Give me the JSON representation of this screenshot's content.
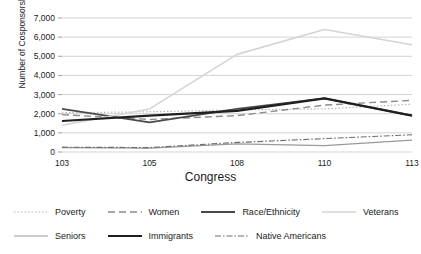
{
  "chart_data": {
    "type": "line",
    "title": "",
    "xlabel": "Congress",
    "ylabel": "Number of Cosponsorships",
    "categories": [
      "103",
      "105",
      "108",
      "110",
      "113"
    ],
    "x": [
      103,
      105,
      108,
      110,
      113
    ],
    "ylim": [
      0,
      7000
    ],
    "ytick_values": [
      0,
      1000,
      2000,
      3000,
      4000,
      5000,
      6000,
      7000
    ],
    "ytick_labels": [
      "0",
      "1,000",
      "2,000",
      "3,000",
      "4,000",
      "5,000",
      "6,000",
      "7,000"
    ],
    "grid": true,
    "legend_position": "bottom",
    "series": [
      {
        "name": "Poverty",
        "values": [
          2050,
          2100,
          2200,
          2250,
          2500
        ],
        "color": "#b5b5b5",
        "style": "dotted",
        "width": 1.2,
        "dash": "1.5,2"
      },
      {
        "name": "Women",
        "values": [
          1950,
          1700,
          1900,
          2450,
          2700
        ],
        "color": "#8c8c8c",
        "style": "dashed",
        "width": 1.4,
        "dash": "7,4"
      },
      {
        "name": "Race/Ethnicity",
        "values": [
          2250,
          1550,
          2250,
          2800,
          1900
        ],
        "color": "#4a4a4a",
        "style": "solid",
        "width": 1.8,
        "dash": "none"
      },
      {
        "name": "Veterans",
        "values": [
          1400,
          2250,
          5100,
          6400,
          5600
        ],
        "color": "#d4d4d4",
        "style": "solid",
        "width": 1.6,
        "dash": "none"
      },
      {
        "name": "Seniors",
        "values": [
          230,
          200,
          420,
          330,
          620
        ],
        "color": "#9a9a9a",
        "style": "solid",
        "width": 1.2,
        "dash": "none"
      },
      {
        "name": "Immigrants",
        "values": [
          1620,
          1900,
          2150,
          2800,
          1900
        ],
        "color": "#1f1f1f",
        "style": "solid",
        "width": 2.2,
        "dash": "none"
      },
      {
        "name": "Native Americans",
        "values": [
          250,
          230,
          500,
          700,
          900
        ],
        "color": "#6e6e6e",
        "style": "dashdot",
        "width": 1.2,
        "dash": "6,2,1.5,2"
      }
    ]
  },
  "legend": {
    "rows": [
      [
        "Poverty",
        "Women",
        "Race/Ethnicity",
        "Veterans"
      ],
      [
        "Seniors",
        "Immigrants",
        "Native Americans"
      ]
    ]
  }
}
